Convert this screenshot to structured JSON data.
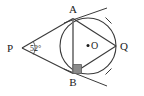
{
  "figure": {
    "background_color": "#ffffff",
    "stroke_color": "#3a3a3a",
    "label_color": "#1a1a1a",
    "width": 144,
    "height": 96
  },
  "labels": {
    "point_p": "P",
    "point_a": "A",
    "point_b": "B",
    "point_q": "Q",
    "center_o": "O",
    "angle_p": "52°"
  },
  "geometry": {
    "circle": {
      "center_x": 88,
      "center_y": 46,
      "radius": 28
    },
    "points": {
      "P": {
        "x": 22,
        "y": 48
      },
      "A": {
        "x": 73,
        "y": 18.5
      },
      "B": {
        "x": 73,
        "y": 73.5
      },
      "Q": {
        "x": 116,
        "y": 46
      },
      "O": {
        "x": 88,
        "y": 46
      }
    },
    "segments": [
      {
        "name": "tangent-PA",
        "x1": 22,
        "y1": 48,
        "x2": 73,
        "y2": 18.5
      },
      {
        "name": "tangent-PB",
        "x1": 22,
        "y1": 48,
        "x2": 73,
        "y2": 73.5
      },
      {
        "name": "chord-AB",
        "x1": 73,
        "y1": 18.5,
        "x2": 73,
        "y2": 73.5
      },
      {
        "name": "chord-AQ",
        "x1": 73,
        "y1": 18.5,
        "x2": 116,
        "y2": 46
      },
      {
        "name": "chord-BQ",
        "x1": 73,
        "y1": 73.5,
        "x2": 116,
        "y2": 46
      },
      {
        "name": "tangent-ray-at-A",
        "x1": 64,
        "y1": 23,
        "x2": 107,
        "y2": 8
      },
      {
        "name": "tangent-ray-at-B",
        "x1": 64,
        "y1": 69,
        "x2": 107,
        "y2": 86
      }
    ],
    "angle_arc_at_p": {
      "cx": 22,
      "cy": 48,
      "r": 13
    },
    "right_angle_marker_at_b": {
      "points": "73,64 81,64 81,73.5 73,73.5"
    },
    "arc_ticks": [
      {
        "name": "tick-arc-AQ",
        "x1": 106,
        "y1": 18,
        "x2": 112,
        "y2": 24
      },
      {
        "name": "tick-arc-BQ",
        "x1": 106,
        "y1": 74,
        "x2": 112,
        "y2": 68
      }
    ]
  },
  "label_positions": {
    "P": {
      "x": 7,
      "y": 52
    },
    "A": {
      "x": 69,
      "y": 13
    },
    "B": {
      "x": 69,
      "y": 86
    },
    "Q": {
      "x": 120,
      "y": 50
    },
    "O": {
      "x": 93,
      "y": 49
    },
    "angle_p": {
      "x": 30,
      "y": 51
    },
    "center_dot": {
      "x": 88,
      "y": 46
    }
  }
}
